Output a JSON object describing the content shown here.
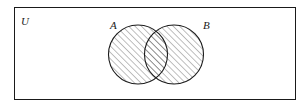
{
  "figure": {
    "kind": "venn-diagram",
    "caption_labels": {
      "universe": "U",
      "set_a": "A",
      "set_b": "B"
    },
    "colors": {
      "background": "#ffffff",
      "stroke": "#1a1a1a",
      "hatch": "#2b2b2b",
      "label": "#1a1a1a"
    },
    "universe_rect": {
      "x": 14,
      "y": 7,
      "width": 282,
      "height": 93,
      "stroke_width": 1
    },
    "circles": [
      {
        "name": "A",
        "cx": 138,
        "cy": 54.5,
        "r": 29.5,
        "shaded": true,
        "label": "A",
        "label_x": 110,
        "label_y": 29
      },
      {
        "name": "B",
        "cx": 174,
        "cy": 54.5,
        "r": 29.5,
        "shaded": true,
        "label": "B",
        "label_x": 203,
        "label_y": 29
      }
    ],
    "universe_label": {
      "text": "U",
      "x": 21,
      "y": 25
    },
    "hatch": {
      "direction": "forward-slash",
      "spacing": 4.5,
      "line_width": 0.6,
      "angle_deg": 45
    },
    "shaded_region": "A union B"
  }
}
